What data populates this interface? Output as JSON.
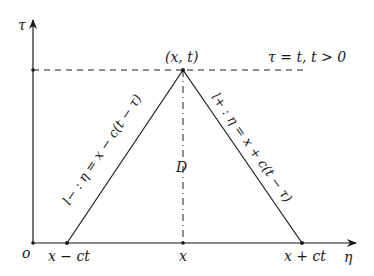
{
  "diagram": {
    "axes": {
      "vertical_label": "τ",
      "horizontal_label": "η",
      "origin_label": "o"
    },
    "apex_label": "(x, t)",
    "horizon_label": "τ = t, t > 0",
    "region_label": "D",
    "left_line_label": "l− : η = x − c(t − τ)",
    "right_line_label": "l+ : η = x + c(t − τ)",
    "base_labels": {
      "left": "x − ct",
      "center": "x",
      "right": "x + ct"
    },
    "colors": {
      "lines": "#1a1a1a",
      "background": "#ffffff"
    }
  }
}
